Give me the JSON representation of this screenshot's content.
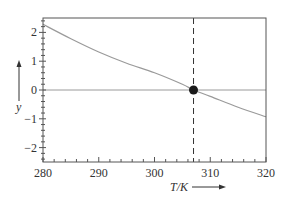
{
  "chart_data": {
    "type": "line",
    "title": "",
    "xlabel": "T/K",
    "ylabel": "y",
    "xlim": [
      280,
      320
    ],
    "ylim": [
      -2.5,
      2.5
    ],
    "x_ticks": [
      280,
      290,
      300,
      310,
      320
    ],
    "y_ticks": [
      2,
      1,
      0,
      -1,
      -2
    ],
    "x_tick_labels": [
      "280",
      "290",
      "300",
      "310",
      "320"
    ],
    "y_tick_labels": [
      "2",
      "1",
      "0",
      "−1",
      "−2"
    ],
    "grid": false,
    "legend": null,
    "series": [
      {
        "name": "y(T)",
        "color": "#9a9a9a",
        "x": [
          280,
          285,
          290,
          295,
          300,
          305,
          307,
          310,
          315,
          320
        ],
        "y": [
          2.28,
          1.78,
          1.32,
          0.93,
          0.6,
          0.2,
          0.0,
          -0.22,
          -0.6,
          -0.93
        ]
      }
    ],
    "reference_lines": [
      {
        "type": "horizontal",
        "y": 0,
        "style": "solid",
        "color": "#9a9a9a"
      },
      {
        "type": "vertical",
        "x": 307,
        "style": "dashed",
        "color": "#333333"
      }
    ],
    "annotations": [
      {
        "type": "point",
        "x": 307,
        "y": 0,
        "marker": "filled-circle",
        "color": "#1a1a1a"
      }
    ]
  },
  "labels": {
    "x_axis": "T/K",
    "y_axis": "y"
  },
  "colors": {
    "frame": "#555555",
    "curve": "#9a9a9a",
    "zero_line": "#9a9a9a",
    "dashed": "#333333",
    "marker": "#1a1a1a"
  }
}
